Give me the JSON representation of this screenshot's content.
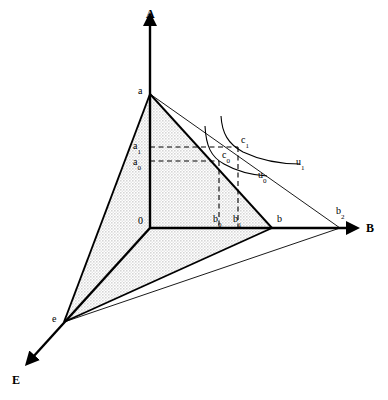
{
  "figure": {
    "background_color": "#ffffff",
    "line_color": "#000000",
    "fill_color": "#e8e8e8",
    "width": 388,
    "height": 400
  },
  "axes": [
    {
      "id": "A",
      "label": "A",
      "label_x": 146,
      "label_y": 8,
      "from": [
        150,
        228
      ],
      "to": [
        150,
        20
      ]
    },
    {
      "id": "B",
      "label": "B",
      "label_x": 366,
      "label_y": 222,
      "from": [
        150,
        228
      ],
      "to": [
        352,
        228
      ]
    },
    {
      "id": "E",
      "label": "E",
      "label_x": 12,
      "label_y": 374,
      "from": [
        150,
        228
      ],
      "to": [
        27,
        362
      ]
    }
  ],
  "points": [
    {
      "id": "a",
      "label": "a",
      "base": "a",
      "sub": "",
      "x": 150,
      "y": 94,
      "label_x": 138,
      "label_y": 86
    },
    {
      "id": "a1",
      "label": "a1",
      "base": "a",
      "sub": "1",
      "x": 150,
      "y": 147,
      "label_x": 133,
      "label_y": 141
    },
    {
      "id": "a0",
      "label": "a0",
      "base": "a",
      "sub": "0",
      "x": 150,
      "y": 161,
      "label_x": 133,
      "label_y": 157
    },
    {
      "id": "0",
      "label": "0",
      "base": "0",
      "sub": "",
      "x": 150,
      "y": 228,
      "label_x": 138,
      "label_y": 216
    },
    {
      "id": "b0",
      "label": "b0",
      "base": "b",
      "sub": "0",
      "x": 219,
      "y": 228,
      "label_x": 213,
      "label_y": 214
    },
    {
      "id": "b1",
      "label": "b1",
      "base": "b",
      "sub": "1",
      "x": 238,
      "y": 228,
      "label_x": 233,
      "label_y": 214
    },
    {
      "id": "b",
      "label": "b",
      "base": "b",
      "sub": "",
      "x": 272,
      "y": 228,
      "label_x": 277,
      "label_y": 214
    },
    {
      "id": "b2",
      "label": "b2",
      "base": "b",
      "sub": "2",
      "x": 340,
      "y": 228,
      "label_x": 336,
      "label_y": 206
    },
    {
      "id": "e",
      "label": "e",
      "base": "e",
      "sub": "",
      "x": 64,
      "y": 322,
      "label_x": 52,
      "label_y": 314
    },
    {
      "id": "c0",
      "label": "c0",
      "base": "c",
      "sub": "0",
      "x": 219,
      "y": 161,
      "label_x": 222,
      "label_y": 150
    },
    {
      "id": "c1",
      "label": "c1",
      "base": "c",
      "sub": "1",
      "x": 238,
      "y": 147,
      "label_x": 241,
      "label_y": 135
    }
  ],
  "curves": [
    {
      "id": "u0",
      "label": "u0",
      "base": "u",
      "sub": "0",
      "label_x": 258,
      "label_y": 170
    },
    {
      "id": "u1",
      "label": "u1",
      "base": "u",
      "sub": "1",
      "label_x": 296,
      "label_y": 157
    }
  ],
  "shaded_region": {
    "name": "budget-simplex-a-e-b",
    "vertices": [
      "a",
      "e",
      "b",
      "0"
    ]
  }
}
